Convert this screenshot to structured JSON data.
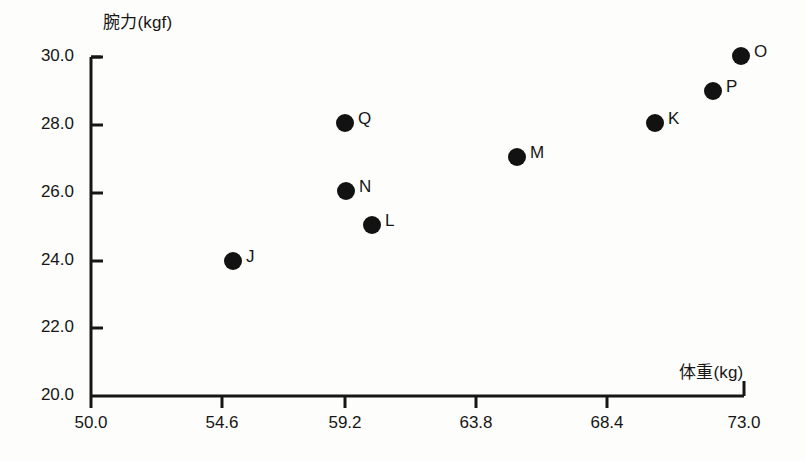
{
  "chart_data": {
    "type": "scatter",
    "title": "",
    "xlabel": "体重(kg)",
    "ylabel": "腕力(kgf)",
    "xlim": [
      50.0,
      73.0
    ],
    "ylim": [
      20.0,
      30.0
    ],
    "xticks": [
      "50.0",
      "54.6",
      "59.2",
      "63.8",
      "68.4",
      "73.0"
    ],
    "yticks": [
      "20.0",
      "22.0",
      "24.0",
      "26.0",
      "28.0",
      "30.0"
    ],
    "grid": false,
    "legend": "none",
    "marker_color": "#121212",
    "axis_color": "#161616",
    "points": [
      {
        "label": "J",
        "x": 55.0,
        "y": 24.0,
        "px": 233,
        "py": 261,
        "lx": 246,
        "ly": 247
      },
      {
        "label": "Q",
        "x": 59.2,
        "y": 28.0,
        "px": 345,
        "py": 123,
        "lx": 358,
        "ly": 109
      },
      {
        "label": "N",
        "x": 59.25,
        "y": 26.0,
        "px": 346,
        "py": 191,
        "lx": 359,
        "ly": 177
      },
      {
        "label": "L",
        "x": 60.15,
        "y": 25.0,
        "px": 372,
        "py": 225,
        "lx": 385,
        "ly": 211
      },
      {
        "label": "M",
        "x": 65.25,
        "y": 27.0,
        "px": 517,
        "py": 157,
        "lx": 530,
        "ly": 143
      },
      {
        "label": "K",
        "x": 70.1,
        "y": 28.0,
        "px": 655,
        "py": 123,
        "lx": 668,
        "ly": 109
      },
      {
        "label": "P",
        "x": 72.1,
        "y": 29.0,
        "px": 713,
        "py": 91,
        "lx": 726,
        "ly": 77
      },
      {
        "label": "O",
        "x": 72.9,
        "y": 30.0,
        "px": 741,
        "py": 56,
        "lx": 754,
        "ly": 42
      }
    ]
  },
  "axis_geometry": {
    "x_origin_px": 91,
    "y_origin_px": 396,
    "x_end_px": 744,
    "y_end_px": 57,
    "x_tick_px": [
      91,
      222,
      345,
      476,
      607,
      744
    ],
    "y_tick_px": [
      396,
      328,
      261,
      193,
      125,
      57
    ],
    "y_label_x": 78,
    "x_label_y": 413
  }
}
